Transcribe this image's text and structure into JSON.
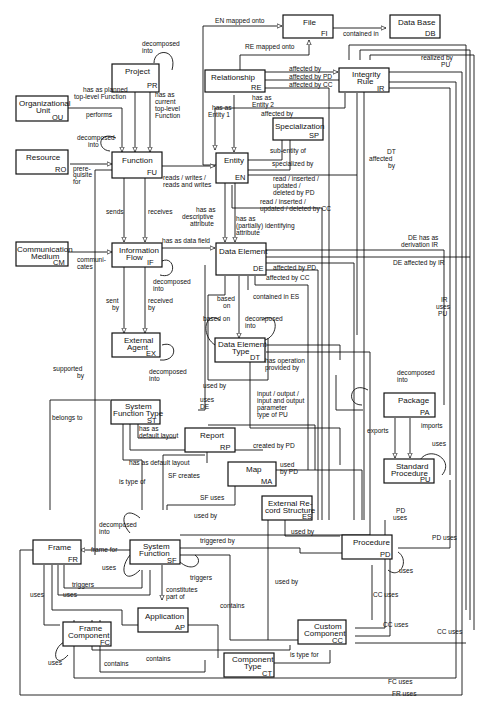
{
  "entities": {
    "project": {
      "name": "Project",
      "abbr": "PR"
    },
    "org_unit": {
      "name1": "Organizational",
      "name2": "Unit",
      "abbr": "OU"
    },
    "resource": {
      "name": "Resource",
      "abbr": "RO"
    },
    "function": {
      "name": "Function",
      "abbr": "FU"
    },
    "file": {
      "name": "File",
      "abbr": "FI"
    },
    "database": {
      "name": "Data Base",
      "abbr": "DB"
    },
    "relationship": {
      "name": "Relationship",
      "abbr": "RE"
    },
    "integrity_rule": {
      "name1": "Integrity",
      "name2": "Rule",
      "abbr": "IR"
    },
    "specialization": {
      "name": "Specialization",
      "abbr": "SP"
    },
    "entity": {
      "name": "Entity",
      "abbr": "EN"
    },
    "comm_medium": {
      "name1": "Communication",
      "name2": "Medium",
      "abbr": "CM"
    },
    "info_flow": {
      "name1": "Information",
      "name2": "Flow",
      "abbr": "IF"
    },
    "data_element": {
      "name": "Data Element",
      "abbr": "DE"
    },
    "external_agent": {
      "name1": "External",
      "name2": "Agent",
      "abbr": "EX"
    },
    "data_element_type": {
      "name1": "Data Element",
      "name2": "Type",
      "abbr": "DT"
    },
    "package": {
      "name": "Package",
      "abbr": "PA"
    },
    "sys_function_type": {
      "name1": "System",
      "name2": "Function Type",
      "abbr": "ST"
    },
    "report": {
      "name": "Report",
      "abbr": "RP"
    },
    "map": {
      "name": "Map",
      "abbr": "MA"
    },
    "standard_procedure": {
      "name1": "Standard",
      "name2": "Procedure",
      "abbr": "PU"
    },
    "external_record": {
      "name1": "External Re-",
      "name2": "cord Structure",
      "abbr": "ES"
    },
    "frame": {
      "name": "Frame",
      "abbr": "FR"
    },
    "system_function": {
      "name1": "System",
      "name2": "Function",
      "abbr": "SF"
    },
    "procedure": {
      "name": "Procedure",
      "abbr": "PD"
    },
    "application": {
      "name": "Application",
      "abbr": "AP"
    },
    "frame_component": {
      "name1": "Frame",
      "name2": "Component",
      "abbr": "FC"
    },
    "custom_component": {
      "name1": "Custom",
      "name2": "Component",
      "abbr": "CC"
    },
    "component_type": {
      "name1": "Component",
      "name2": "Type",
      "abbr": "CT"
    }
  },
  "relations": {
    "en_mapped_onto": "EN mapped onto",
    "contained_in": "contained in",
    "re_mapped_onto": "RE mapped onto",
    "pr_decomposed_1": "decomposed",
    "pr_decomposed_2": "into",
    "planned_1": "has as planned",
    "planned_2": "top-level Function",
    "current_1": "has as",
    "current_2": "current",
    "current_3": "top-level",
    "current_4": "Function",
    "performs": "performs",
    "fu_decomposed_1": "decomposed",
    "fu_decomposed_2": "into",
    "prereq_1": "prere-",
    "prereq_2": "quisite",
    "prereq_3": "for",
    "reads_1": "reads / writes /",
    "reads_2": "reads and writes",
    "has_entity1_1": "has as",
    "has_entity1_2": "Entity 1",
    "has_entity2_1": "has as",
    "has_entity2_2": "Entity 2",
    "re_affected_by": "affected by",
    "re_affected_pd": "affected by PD",
    "re_affected_cc": "affected by CC",
    "realized_pu_1": "realized by",
    "realized_pu_2": "PU",
    "en_affected_by": "affected by",
    "sub_entity": "sub-entity of",
    "specialized_by": "specialized by",
    "dt_affected_1": "DT",
    "dt_affected_2": "affected",
    "dt_affected_3": "by",
    "rw_pd_1": "read / inserted /",
    "rw_pd_2": "updated /",
    "rw_pd_3": "deleted by PD",
    "rw_cc_1": "read / inserted /",
    "rw_cc_2": "updated / deleted by CC",
    "sends": "sends",
    "receives": "receives",
    "descr_1": "has as",
    "descr_2": "descriptive",
    "descr_3": "attribute",
    "ident_1": "has as",
    "ident_2": "(partially) identifying",
    "ident_3": "attribute",
    "data_field": "has as data field",
    "communicates_1": "communi-",
    "communicates_2": "cates",
    "if_decomposed_1": "decomposed",
    "if_decomposed_2": "into",
    "de_derivation_1": "DE has as",
    "de_derivation_2": "derivation IR",
    "de_affected_ir": "DE affected by IR",
    "de_affected_pd": "affected by PD",
    "de_affected_cc": "affected by CC",
    "contained_es": "contained in ES",
    "sent_by_1": "sent",
    "sent_by_2": "by",
    "received_by_1": "received",
    "received_by_2": "by",
    "based_on_1": "based",
    "based_on_2": "on",
    "dt_based_on": "based on",
    "dt_decomposed_1": "decomposed",
    "dt_decomposed_2": "into",
    "ir_uses_1": "IR",
    "ir_uses_2": "uses",
    "ir_uses_3": "PU",
    "ex_decomposed_1": "decomposed",
    "ex_decomposed_2": "into",
    "supported_1": "supported",
    "supported_2": "by",
    "operation_1": "has operation",
    "operation_2": "provided by",
    "used_by": "used by",
    "uses_de_1": "uses",
    "uses_de_2": "DE",
    "io_1": "input / output /",
    "io_2": "input and output",
    "io_3": "parameter",
    "io_4": "type of PU",
    "pa_decomposed_1": "decomposed",
    "pa_decomposed_2": "into",
    "belongs_to": "belongs to",
    "st_default_1": "has as",
    "st_default_2": "default layout",
    "exports": "exports",
    "imports": "imports",
    "default_layout": "has as default layout",
    "created_by_pd": "created by PD",
    "pu_uses": "uses",
    "sf_creates": "SF creates",
    "is_type_of": "is type of",
    "used_by_pd_1": "used",
    "used_by_pd_2": "by PD",
    "sf_uses": "SF uses",
    "pd_uses_1": "PD",
    "pd_uses_2": "uses",
    "pd_uses_right": "PD uses",
    "sf_used_by": "used by",
    "es_used_by": "used by",
    "sf_decomposed_1": "decomposed",
    "sf_decomposed_2": "into",
    "frame_for": "frame for",
    "triggered_by": "triggered by",
    "sf_uses_self": "uses",
    "triggers_sf": "triggers",
    "pd_self_uses": "uses",
    "fr_triggers": "triggers",
    "fr_uses": "uses",
    "constitutes_1": "constitutes",
    "constitutes_2": "part of",
    "contains_sf": "contains",
    "cc_used_by": "used by",
    "cc_uses_1": "CC uses",
    "cc_uses_2": "CC uses",
    "cc_uses_3": "CC uses",
    "fc_used": "uses",
    "fc_self_uses": "uses",
    "contains_1": "contains",
    "contains_2": "contains",
    "is_type_for": "is type for",
    "fc_uses": "FC uses",
    "fr_uses_bottom": "FR uses"
  }
}
